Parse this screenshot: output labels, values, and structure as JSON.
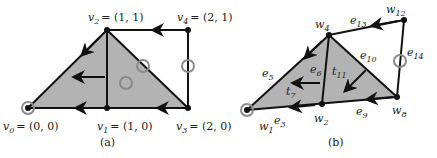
{
  "panel_a": {
    "caption": "(a)",
    "vertices": [
      {
        "id": "v0",
        "label": "v",
        "sub": "0",
        "coord": "= (0, 0)",
        "x": 28,
        "y": 108
      },
      {
        "id": "v1",
        "label": "v",
        "sub": "1",
        "coord": "= (1, 0)",
        "x": 107,
        "y": 108
      },
      {
        "id": "v2",
        "label": "v",
        "sub": "2",
        "coord": "= (1, 1)",
        "x": 107,
        "y": 30
      },
      {
        "id": "v3",
        "label": "v",
        "sub": "3",
        "coord": "= (2, 0)",
        "x": 188,
        "y": 108
      },
      {
        "id": "v4",
        "label": "v",
        "sub": "4",
        "coord": "= (2, 1)",
        "x": 188,
        "y": 30
      }
    ]
  },
  "panel_b": {
    "caption": "(b)",
    "vertex_labels": {
      "w1": "w",
      "w2": "w",
      "w4": "w",
      "w8": "w",
      "w12": "w"
    },
    "vertex_subs": {
      "w1": "1",
      "w2": "2",
      "w4": "4",
      "w8": "8",
      "w12": "12"
    },
    "edge_labels": {
      "e3": "e",
      "e5": "e",
      "e6": "e",
      "e9": "e",
      "e10": "e",
      "e13": "e",
      "e14": "e"
    },
    "edge_subs": {
      "e3": "3",
      "e5": "5",
      "e6": "6",
      "e9": "9",
      "e10": "10",
      "e13": "13",
      "e14": "14"
    },
    "triangle_labels": {
      "t7": "t",
      "t11": "t"
    },
    "triangle_subs": {
      "t7": "7",
      "t11": "11"
    }
  },
  "colors": {
    "fill": "#b3b3b3",
    "stroke": "#111111",
    "marker": "#8a8a8a"
  }
}
